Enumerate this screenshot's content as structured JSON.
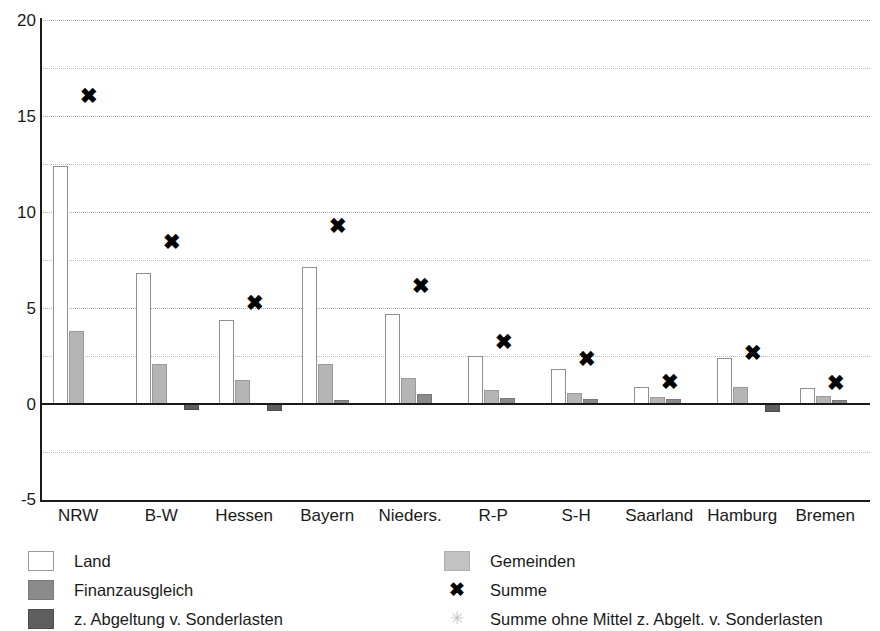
{
  "chart_data": {
    "type": "bar",
    "title": "",
    "subtitle": "",
    "xlabel": "",
    "ylabel": "",
    "ylim": [
      -5,
      20
    ],
    "y_ticks": [
      -5,
      0,
      5,
      10,
      15,
      20
    ],
    "y_tick_labels": [
      "-5",
      "0",
      "5",
      "10",
      "15",
      "20"
    ],
    "gridlines": [
      -2.5,
      0,
      2.5,
      5,
      7.5,
      10,
      12.5,
      15,
      17.5,
      20
    ],
    "grid": true,
    "legend_position": "below",
    "categories": [
      "NRW",
      "B-W",
      "Hessen",
      "Bayern",
      "Nieders.",
      "R-P",
      "S-H",
      "Saarland",
      "Hamburg",
      "Bremen"
    ],
    "series": [
      {
        "name": "Land",
        "style": "bar",
        "color": "#ffffff",
        "values": [
          12.4,
          6.8,
          4.4,
          7.15,
          4.7,
          2.5,
          1.8,
          0.9,
          2.4,
          0.85
        ]
      },
      {
        "name": "Gemeinden",
        "style": "bar",
        "color": "#b5b5b5",
        "values": [
          3.8,
          2.1,
          1.25,
          2.1,
          1.35,
          0.75,
          0.55,
          0.35,
          0.9,
          0.4
        ]
      },
      {
        "name": "Finanzausgleich",
        "style": "bar",
        "color": "#8a8a8a",
        "values": [
          0,
          0,
          0,
          0.2,
          0.5,
          0.3,
          0.25,
          0.25,
          0,
          0.2
        ]
      },
      {
        "name": "z. Abgeltung v. Sonderlasten",
        "style": "bar",
        "color": "#5e5e5e",
        "values": [
          0,
          -0.3,
          -0.35,
          0,
          0,
          0,
          0,
          0,
          -0.4,
          0
        ]
      },
      {
        "name": "Summe",
        "style": "marker",
        "marker": "x",
        "color": "#000000",
        "values": [
          16.1,
          8.5,
          5.3,
          9.3,
          6.2,
          3.3,
          2.4,
          1.2,
          2.7,
          1.15
        ]
      },
      {
        "name": "Summe ohne Mittel z. Abgelt. v. Sonderlasten",
        "style": "marker",
        "marker": "star",
        "color": "#c4c4c4",
        "values": [
          null,
          null,
          null,
          null,
          null,
          null,
          null,
          null,
          null,
          null
        ]
      }
    ]
  },
  "axis": {
    "y_labels": [
      "20",
      "15",
      "10",
      "5",
      "0",
      "-5"
    ]
  },
  "legend": {
    "left": [
      {
        "label": "Land",
        "swatch": "land-swatch"
      },
      {
        "label": "Finanzausgleich",
        "swatch": "finanzausgleich-swatch"
      },
      {
        "label": "z. Abgeltung v. Sonderlasten",
        "swatch": "sonderlasten-swatch"
      }
    ],
    "right": [
      {
        "label": "Gemeinden",
        "swatch": "gemeinden-swatch"
      },
      {
        "label": "Summe",
        "swatch": "summe-marker",
        "glyph": "✖"
      },
      {
        "label": "Summe ohne Mittel z. Abgelt. v. Sonderlasten",
        "swatch": "summe-ohne-marker",
        "glyph": "✳"
      }
    ]
  }
}
